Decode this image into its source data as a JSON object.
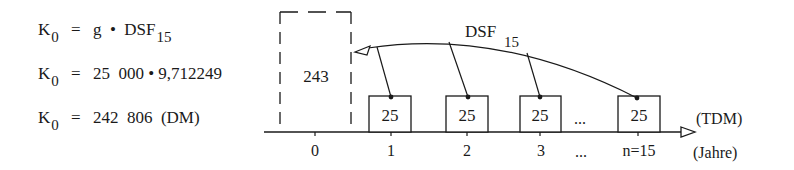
{
  "formulas": [
    {
      "lhs": "K",
      "lhs_sub": "0",
      "eq": "=",
      "rhs_main": "g  •  DSF",
      "rhs_sub": "15"
    },
    {
      "lhs": "K",
      "lhs_sub": "0",
      "eq": "=",
      "rhs_main": "25  000 • 9,712249",
      "rhs_sub": ""
    },
    {
      "lhs": "K",
      "lhs_sub": "0",
      "eq": "=",
      "rhs_main": "242  806  (DM)",
      "rhs_sub": ""
    }
  ],
  "timeline": {
    "present_value_box": {
      "label": "243",
      "style": "dashed"
    },
    "payment_boxes": [
      {
        "period": "1",
        "label": "25"
      },
      {
        "period": "2",
        "label": "25"
      },
      {
        "period": "3",
        "label": "25"
      },
      {
        "period": "n=15",
        "label": "25"
      }
    ],
    "ellipsis_box": "...",
    "ellipsis_tick": "...",
    "period_zero": "0",
    "discount_label": "DSF",
    "discount_label_sub": "15",
    "unit_value": "(TDM)",
    "unit_axis": "(Jahre)"
  },
  "colors": {
    "ink": "#1a1a1a",
    "background": "#ffffff"
  }
}
